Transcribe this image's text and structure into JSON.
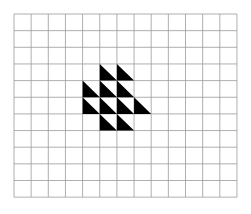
{
  "figure": {
    "background_color": "#ffffff",
    "canvas": {
      "width": 251,
      "height": 214
    },
    "grid": {
      "name": "square-lattice",
      "columns": 13,
      "rows": 11,
      "origin_x": 14,
      "origin_y": 14,
      "cell_width": 17.15,
      "cell_height": 16.65,
      "line_color": "#9a9a9a",
      "line_width": 0.8,
      "fill_color": "#ffffff"
    },
    "shapes": {
      "name": "black-right-triangles",
      "fill_color": "#000000",
      "orientation": "right-angle-bottom-left",
      "hypotenuse": "top-left-to-bottom-right",
      "count": 11,
      "rows": [
        {
          "row_index": 3,
          "columns": [
            5,
            6
          ]
        },
        {
          "row_index": 4,
          "columns": [
            4,
            5,
            6
          ]
        },
        {
          "row_index": 5,
          "columns": [
            4,
            5,
            6,
            7
          ]
        },
        {
          "row_index": 6,
          "columns": [
            5,
            6
          ]
        }
      ]
    }
  }
}
